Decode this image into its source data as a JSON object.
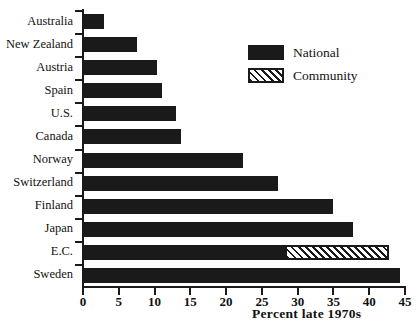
{
  "chart_data": {
    "type": "bar",
    "orientation": "horizontal",
    "title": "",
    "xlabel": "Percent late 1970s",
    "ylabel": "",
    "xlim": [
      0,
      45
    ],
    "xticks": [
      0,
      5,
      10,
      15,
      20,
      25,
      30,
      35,
      40,
      45
    ],
    "grid": false,
    "stacked": true,
    "legend_position": "upper-right",
    "categories": [
      "Australia",
      "New Zealand",
      "Austria",
      "Spain",
      "U.S.",
      "Canada",
      "Norway",
      "Switzerland",
      "Finland",
      "Japan",
      "E.C.",
      "Sweden"
    ],
    "series": [
      {
        "name": "National",
        "values": [
          3.0,
          7.5,
          10.3,
          11.0,
          13.0,
          13.7,
          22.3,
          27.3,
          35.0,
          37.8,
          28.5,
          44.3
        ]
      },
      {
        "name": "Community",
        "values": [
          0,
          0,
          0,
          0,
          0,
          0,
          0,
          0,
          0,
          0,
          14.2,
          0
        ]
      }
    ],
    "totals": [
      3.0,
      7.5,
      10.3,
      11.0,
      13.0,
      13.7,
      22.3,
      27.3,
      35.0,
      37.8,
      42.7,
      44.3
    ]
  },
  "legend": {
    "items": [
      {
        "label": "National",
        "swatch": "solid-black-swatch",
        "color": "#1a1a1a"
      },
      {
        "label": "Community",
        "swatch": "diagonal-hatch-swatch",
        "color": "#1a1a1a"
      }
    ]
  },
  "axis": {
    "x_title": "Percent late 1970s",
    "x_tick_labels": [
      "0",
      "5",
      "10",
      "15",
      "20",
      "25",
      "30",
      "35",
      "40",
      "45"
    ]
  },
  "caption": {
    "text": ""
  }
}
